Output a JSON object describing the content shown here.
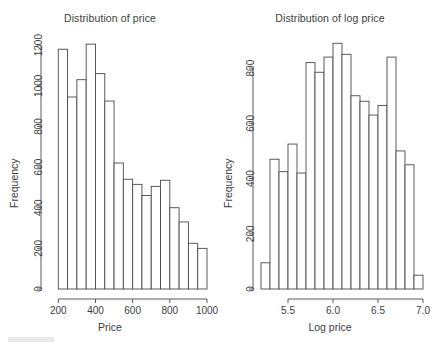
{
  "figure": {
    "background_color": "#ffffff",
    "line_color": "#4a4a4a",
    "text_color": "#3d3d3d"
  },
  "panels": [
    {
      "name": "price-histogram",
      "title": "Distribution of price",
      "xlabel": "Price",
      "ylabel": "Frequency"
    },
    {
      "name": "log-price-histogram",
      "title": "Distribution of log price",
      "xlabel": "Log price",
      "ylabel": "Frequency"
    }
  ],
  "chart_data": [
    {
      "type": "bar",
      "subtype": "histogram",
      "name": "price-histogram",
      "title": "Distribution of price",
      "xlabel": "Price",
      "ylabel": "Frequency",
      "xlim": [
        150,
        1000
      ],
      "ylim": [
        0,
        1250
      ],
      "xticks": [
        200,
        400,
        600,
        800,
        1000
      ],
      "xticklabels": [
        "200",
        "400",
        "600",
        "800",
        "1000"
      ],
      "yticks": [
        0,
        200,
        400,
        600,
        800,
        1000,
        1200
      ],
      "yticklabels": [
        "0",
        "200",
        "400",
        "600",
        "800",
        "1000",
        "1200"
      ],
      "grid": false,
      "legend": null,
      "bin_width": 50,
      "bin_edges": [
        200,
        250,
        300,
        350,
        400,
        450,
        500,
        550,
        600,
        650,
        700,
        750,
        800,
        850,
        900,
        950,
        1000
      ],
      "bin_centers": [
        225,
        275,
        325,
        375,
        425,
        475,
        525,
        575,
        625,
        675,
        725,
        775,
        825,
        875,
        925,
        975
      ],
      "values": [
        1180,
        945,
        1030,
        1205,
        1060,
        925,
        620,
        540,
        515,
        460,
        505,
        535,
        400,
        330,
        225,
        200
      ]
    },
    {
      "type": "bar",
      "subtype": "histogram",
      "name": "log-price-histogram",
      "title": "Distribution of log price",
      "xlabel": "Log price",
      "ylabel": "Frequency",
      "xlim": [
        5.2,
        7.0
      ],
      "ylim": [
        0,
        920
      ],
      "xticks": [
        5.5,
        6.0,
        6.5,
        7.0
      ],
      "xticklabels": [
        "5.5",
        "6.0",
        "6.5",
        "7.0"
      ],
      "yticks": [
        0,
        200,
        400,
        600,
        800
      ],
      "yticklabels": [
        "0",
        "200",
        "400",
        "600",
        "800"
      ],
      "grid": false,
      "legend": null,
      "bin_width": 0.1,
      "bin_edges": [
        5.2,
        5.3,
        5.4,
        5.5,
        5.6,
        5.7,
        5.8,
        5.9,
        6.0,
        6.1,
        6.2,
        6.3,
        6.4,
        6.5,
        6.6,
        6.7,
        6.8,
        6.9,
        7.0
      ],
      "bin_centers": [
        5.25,
        5.35,
        5.45,
        5.55,
        5.65,
        5.75,
        5.85,
        5.95,
        6.05,
        6.15,
        6.25,
        6.35,
        6.45,
        6.55,
        6.65,
        6.75,
        6.85,
        6.95
      ],
      "values": [
        95,
        470,
        425,
        525,
        420,
        820,
        785,
        840,
        890,
        850,
        700,
        680,
        630,
        665,
        840,
        500,
        450,
        50
      ]
    }
  ]
}
